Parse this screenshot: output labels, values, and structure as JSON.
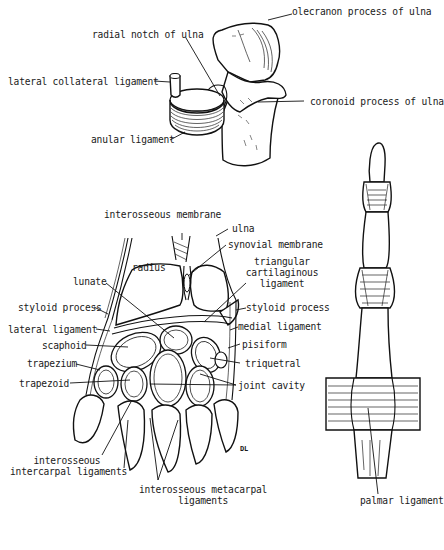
{
  "figure": {
    "colors": {
      "ink": "#111111",
      "background": "#ffffff"
    },
    "panels": [
      {
        "id": "elbow",
        "subject": "proximal ulna with anular ligament",
        "labels": [
          "olecranon process of ulna",
          "radial notch of ulna",
          "lateral collateral ligament",
          "coronoid process of ulna",
          "anular ligament"
        ]
      },
      {
        "id": "wrist",
        "subject": "coronal section of wrist joint",
        "labels": [
          "interosseous membrane",
          "ulna",
          "synovial membrane",
          "radius",
          "triangular\ncartilaginous\nligament",
          "lunate",
          "styloid process",
          "styloid process",
          "lateral ligament",
          "medial ligament",
          "scaphoid",
          "pisiform",
          "trapezium",
          "triquetral",
          "trapezoid",
          "joint cavity",
          "interosseous\nintercarpal ligaments",
          "interosseous metacarpal\nligaments"
        ],
        "signature": "DL"
      },
      {
        "id": "finger",
        "subject": "finger joints with palmar ligament",
        "labels": [
          "palmar ligament"
        ]
      }
    ]
  },
  "labels": {
    "olecranon": "olecranon process of ulna",
    "radial_notch": "radial notch of ulna",
    "lateral_collateral": "lateral collateral ligament",
    "coronoid": "coronoid process of ulna",
    "anular": "anular ligament",
    "interosseous_membrane": "interosseous membrane",
    "ulna": "ulna",
    "synovial_membrane": "synovial membrane",
    "radius": "radius",
    "triangular_1": "triangular",
    "triangular_2": "cartilaginous",
    "triangular_3": "ligament",
    "lunate": "lunate",
    "styloid_left": "styloid process",
    "styloid_right": "styloid process",
    "lateral_ligament": "lateral ligament",
    "medial_ligament": "medial ligament",
    "scaphoid": "scaphoid",
    "pisiform": "pisiform",
    "trapezium": "trapezium",
    "triquetral": "triquetral",
    "trapezoid": "trapezoid",
    "joint_cavity": "joint cavity",
    "intercarpal_1": "interosseous",
    "intercarpal_2": "intercarpal ligaments",
    "metacarpal_1": "interosseous metacarpal",
    "metacarpal_2": "ligaments",
    "palmar": "palmar ligament",
    "signature": "DL"
  }
}
